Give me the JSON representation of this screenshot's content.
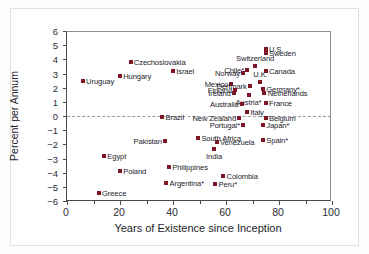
{
  "chart_data": {
    "type": "scatter",
    "title": "",
    "xlabel": "Years of Existence since Inception",
    "ylabel": "Percent per Annum",
    "xlim": [
      0,
      100
    ],
    "ylim": [
      -6,
      6
    ],
    "xticks": [
      0,
      20,
      40,
      60,
      80,
      100
    ],
    "xticks_minor": [
      10,
      30,
      50,
      70,
      90
    ],
    "yticks": [
      6,
      5,
      4,
      3,
      2,
      1,
      0,
      -1,
      -2,
      -3,
      -4,
      -5,
      -6
    ],
    "ytick_labels": [
      "6",
      "5",
      "4",
      "3",
      "2",
      "1",
      "0",
      "−1",
      "−2",
      "−3",
      "−4",
      "−5",
      "−6"
    ],
    "grid": false,
    "legend": null,
    "zero_reference_line": {
      "y": 0,
      "style": "dashed",
      "color": "#9a9aa2"
    },
    "marker": {
      "shape": "square",
      "color": "#7d1728",
      "size": 4
    },
    "points": [
      {
        "label": "Uruguay",
        "x": 6,
        "y": 2.45,
        "pos": "right"
      },
      {
        "label": "Hungary",
        "x": 20,
        "y": 2.85,
        "pos": "right"
      },
      {
        "label": "Czechoslovakia",
        "x": 24,
        "y": 3.8,
        "pos": "right"
      },
      {
        "label": "Israel",
        "x": 40,
        "y": 3.15,
        "pos": "right"
      },
      {
        "label": "Chile*",
        "x": 68,
        "y": 3.25,
        "pos": "left"
      },
      {
        "label": "Norway",
        "x": 66.5,
        "y": 3.05,
        "pos": "left"
      },
      {
        "label": "Switzerland",
        "x": 71,
        "y": 3.5,
        "pos": "above"
      },
      {
        "label": "Canada",
        "x": 75,
        "y": 3.15,
        "pos": "right"
      },
      {
        "label": "Sweden",
        "x": 75,
        "y": 4.45,
        "pos": "right"
      },
      {
        "label": "U.S.",
        "x": 75,
        "y": 4.75,
        "pos": "right"
      },
      {
        "label": "Mexico",
        "x": 62,
        "y": 2.25,
        "pos": "left"
      },
      {
        "label": "Denmark",
        "x": 69,
        "y": 2.15,
        "pos": "left"
      },
      {
        "label": "U.K.",
        "x": 73,
        "y": 2.4,
        "pos": "above"
      },
      {
        "label": "Finland",
        "x": 63.5,
        "y": 1.85,
        "pos": "left"
      },
      {
        "label": "Germany*",
        "x": 74,
        "y": 1.9,
        "pos": "right"
      },
      {
        "label": "Ireland",
        "x": 63,
        "y": 1.6,
        "pos": "left"
      },
      {
        "label": "Netherlands",
        "x": 74.5,
        "y": 1.6,
        "pos": "right"
      },
      {
        "label": "Austria*",
        "x": 68.5,
        "y": 1.5,
        "pos": "below"
      },
      {
        "label": "Australia",
        "x": 66,
        "y": 0.85,
        "pos": "left"
      },
      {
        "label": "France",
        "x": 75,
        "y": 0.95,
        "pos": "right"
      },
      {
        "label": "Italy",
        "x": 68,
        "y": 0.25,
        "pos": "right"
      },
      {
        "label": "Brazil",
        "x": 36,
        "y": -0.1,
        "pos": "right"
      },
      {
        "label": "New Zealand",
        "x": 65,
        "y": -0.15,
        "pos": "left"
      },
      {
        "label": "Belgium",
        "x": 75,
        "y": -0.15,
        "pos": "right"
      },
      {
        "label": "Portugal*",
        "x": 66.5,
        "y": -0.6,
        "pos": "left"
      },
      {
        "label": "Japan*",
        "x": 74,
        "y": -0.65,
        "pos": "right"
      },
      {
        "label": "South Africa",
        "x": 49.5,
        "y": -1.55,
        "pos": "right"
      },
      {
        "label": "Spain*",
        "x": 74,
        "y": -1.7,
        "pos": "right"
      },
      {
        "label": "Pakistan",
        "x": 37,
        "y": -1.75,
        "pos": "left"
      },
      {
        "label": "Venezuela",
        "x": 56.5,
        "y": -1.85,
        "pos": "right"
      },
      {
        "label": "India",
        "x": 55.5,
        "y": -2.35,
        "pos": "below"
      },
      {
        "label": "Egypt",
        "x": 14,
        "y": -2.85,
        "pos": "right"
      },
      {
        "label": "Philippines",
        "x": 38.5,
        "y": -3.6,
        "pos": "right"
      },
      {
        "label": "Poland",
        "x": 20,
        "y": -3.9,
        "pos": "right"
      },
      {
        "label": "Colombia",
        "x": 59,
        "y": -4.2,
        "pos": "right"
      },
      {
        "label": "Argentina*",
        "x": 37.5,
        "y": -4.75,
        "pos": "right"
      },
      {
        "label": "Peru*",
        "x": 56,
        "y": -4.8,
        "pos": "right"
      },
      {
        "label": "Greece",
        "x": 12,
        "y": -5.45,
        "pos": "right"
      }
    ]
  }
}
